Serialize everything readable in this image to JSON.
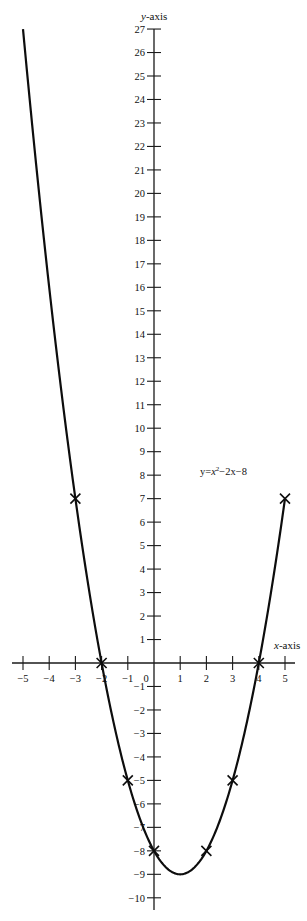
{
  "chart_data": {
    "type": "line",
    "title": "",
    "equation_label": "y=x²−2x−8",
    "equation_parts": {
      "lhs": "y=",
      "var": "x",
      "exp": "2",
      "rest": "−2x−8"
    },
    "xlabel": "x-axis",
    "ylabel": "y-axis",
    "xlim": [
      -5,
      5
    ],
    "ylim": [
      -10,
      27
    ],
    "grid": false,
    "legend": null,
    "x_ticks": [
      -5,
      -4,
      -3,
      -2,
      -1,
      0,
      1,
      2,
      3,
      4,
      5
    ],
    "y_ticks": [
      -10,
      -9,
      -8,
      -7,
      -6,
      -5,
      -4,
      -3,
      -2,
      -1,
      1,
      2,
      3,
      4,
      5,
      6,
      7,
      8,
      9,
      10,
      11,
      12,
      13,
      14,
      15,
      16,
      17,
      18,
      19,
      20,
      21,
      22,
      23,
      24,
      25,
      26,
      27
    ],
    "series": [
      {
        "name": "y = x^2 - 2x - 8",
        "function": {
          "a": 1,
          "b": -2,
          "c": -8
        },
        "x_range": [
          -5,
          5
        ],
        "vertex": [
          1,
          -9
        ]
      }
    ],
    "marked_points": [
      {
        "x": -3,
        "y": 7
      },
      {
        "x": -2,
        "y": 0
      },
      {
        "x": -1,
        "y": -5
      },
      {
        "x": 0,
        "y": -8
      },
      {
        "x": 2,
        "y": -8
      },
      {
        "x": 3,
        "y": -5
      },
      {
        "x": 4,
        "y": 0
      },
      {
        "x": 5,
        "y": 7
      }
    ],
    "layout": {
      "origin_px": [
        154,
        663
      ],
      "x_unit_px": 26.2,
      "y_unit_px": 23.48,
      "x_axis_span_px": [
        12,
        295
      ],
      "y_axis_span_px": [
        29,
        910
      ],
      "equation_label_pos_px": [
        200,
        475
      ],
      "xlabel_pos_px": [
        274,
        649
      ],
      "ylabel_pos_px": [
        141,
        20
      ]
    }
  }
}
